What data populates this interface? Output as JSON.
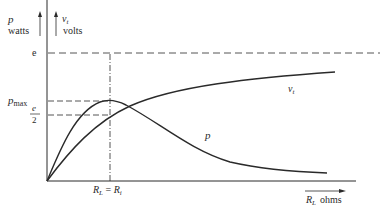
{
  "diagram": {
    "y_axis": {
      "left_quantity": "p",
      "left_unit": "watts",
      "right_quantity": "v",
      "right_quantity_sub": "t",
      "right_unit": "volts"
    },
    "x_axis": {
      "quantity": "R",
      "quantity_sub": "L",
      "unit": "ohms"
    },
    "y_ticks": {
      "e": "e",
      "p_max": "p",
      "p_max_sub": "max",
      "half_e_num": "e",
      "half_e_den": "2"
    },
    "x_tick": {
      "left": "R",
      "left_sub": "L",
      "eq": " = ",
      "right": "R",
      "right_sub": "i"
    },
    "curves": {
      "voltage_label": "v",
      "voltage_label_sub": "t",
      "power_label": "p"
    },
    "colors": {
      "ink": "#2a2a2a",
      "background": "#ffffff"
    }
  }
}
